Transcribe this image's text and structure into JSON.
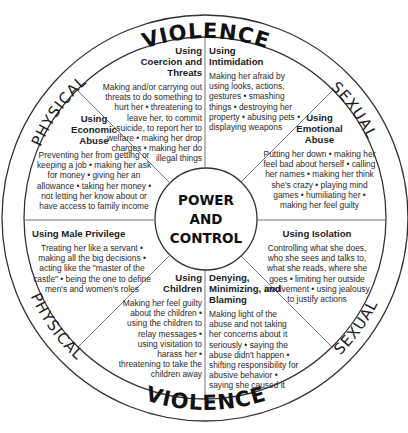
{
  "ring": {
    "top": {
      "left": "PHYSICAL",
      "center": "VIOLENCE",
      "right": "SEXUAL"
    },
    "bottom": {
      "left": "PHYSICAL",
      "center": "VIOLENCE",
      "right": "SEXUAL"
    }
  },
  "hub": {
    "line1": "POWER",
    "line2": "AND",
    "line3": "CONTROL"
  },
  "sectors": [
    {
      "title": "Using Coercion and Threats",
      "body": "Making and/or carrying out threats to do something to hurt her • threatening to leave her, to commit suicide, to report her to welfare • making her drop charges • making her do illegal things"
    },
    {
      "title": "Using Intimidation",
      "body": "Making her afraid by using looks, actions, gestures • smashing things • destroying her property • abusing pets • displaying weapons"
    },
    {
      "title": "Using Emotional Abuse",
      "body": "Putting her down • making her feel bad about herself • calling her names • making her think she's crazy • playing mind games • humiliating her • making her feel guilty"
    },
    {
      "title": "Using Isolation",
      "body": "Controlling what she does, who she sees and talks to, what she reads, where she goes • limiting her outside involvement • using jealousy to justify actions"
    },
    {
      "title": "Denying, Minimizing, and Blaming",
      "body": "Making light of the abuse and not taking her concerns about it seriously • saying the abuse didn't happen • shifting responsibility for abusive behavior • saying she caused it"
    },
    {
      "title": "Using Children",
      "body": "Making her feel guilty about the children • using the children to relay messages • using visitation to harass her • threatening to take the children away"
    },
    {
      "title": "Using Male Privilege",
      "body": "Treating her like a servant • making all the big decisions • acting like the \"master of the castle\" • being the one to define men's and women's roles"
    },
    {
      "title": "Using Economic Abuse",
      "body": "Preventing her from getting or keeping a job • making her ask for money • giving her an allowance • taking her money • not letting her know about or have access to family income"
    }
  ],
  "colors": {
    "line": "#333333",
    "text": "#222222",
    "background": "#ffffff"
  }
}
